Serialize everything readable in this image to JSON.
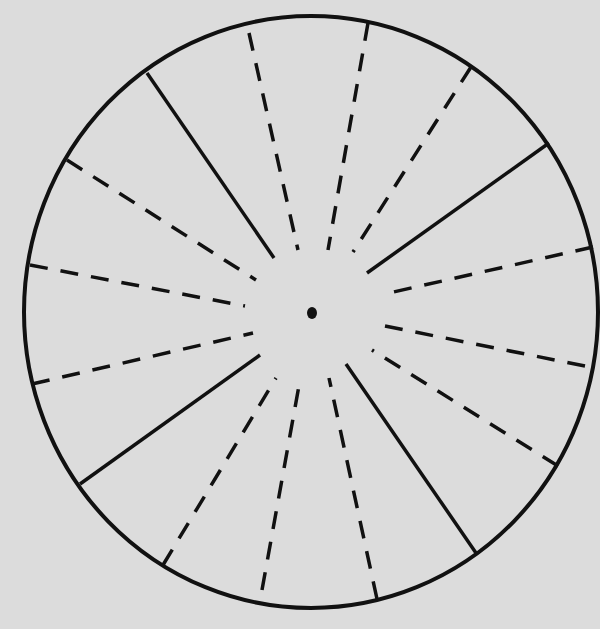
{
  "diagram": {
    "type": "radial-wheel",
    "background": "#dcdcdc",
    "stroke": "#111111",
    "circle": {
      "cx": 311,
      "cy": 312,
      "rx": 287,
      "ry": 296
    },
    "center_dot": {
      "cx": 312,
      "cy": 313,
      "r": 5
    },
    "solid_spokes": [
      {
        "x1": 147,
        "y1": 73,
        "x2": 274,
        "y2": 258
      },
      {
        "x1": 549,
        "y1": 143,
        "x2": 367,
        "y2": 273
      },
      {
        "x1": 80,
        "y1": 484,
        "x2": 260,
        "y2": 355
      },
      {
        "x1": 476,
        "y1": 553,
        "x2": 346,
        "y2": 364
      }
    ],
    "dashed_spokes": [
      {
        "x1": 249,
        "y1": 33,
        "x2": 298,
        "y2": 250
      },
      {
        "x1": 368,
        "y1": 23,
        "x2": 328,
        "y2": 250
      },
      {
        "x1": 471,
        "y1": 67,
        "x2": 353,
        "y2": 252
      },
      {
        "x1": 67,
        "y1": 160,
        "x2": 256,
        "y2": 280
      },
      {
        "x1": 30,
        "y1": 265,
        "x2": 245,
        "y2": 306
      },
      {
        "x1": 593,
        "y1": 247,
        "x2": 389,
        "y2": 293
      },
      {
        "x1": 32,
        "y1": 384,
        "x2": 253,
        "y2": 333
      },
      {
        "x1": 585,
        "y1": 366,
        "x2": 385,
        "y2": 326
      },
      {
        "x1": 558,
        "y1": 466,
        "x2": 372,
        "y2": 350
      },
      {
        "x1": 163,
        "y1": 565,
        "x2": 276,
        "y2": 378
      },
      {
        "x1": 262,
        "y1": 590,
        "x2": 300,
        "y2": 380
      },
      {
        "x1": 377,
        "y1": 599,
        "x2": 329,
        "y2": 378
      }
    ]
  }
}
